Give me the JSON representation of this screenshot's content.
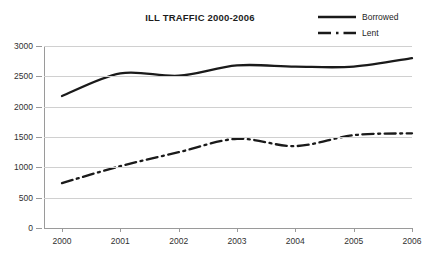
{
  "chart_data": {
    "type": "line",
    "title": "ILL TRAFFIC 2000-2006",
    "xlabel": "",
    "ylabel": "",
    "categories": [
      "2000",
      "2001",
      "2002",
      "2003",
      "2004",
      "2005",
      "2006"
    ],
    "x": [
      2000,
      2001,
      2002,
      2003,
      2004,
      2005,
      2006
    ],
    "series": [
      {
        "name": "Borrowed",
        "style": "solid",
        "color": "#1a1a1a",
        "values": [
          2175,
          2550,
          2510,
          2680,
          2660,
          2660,
          2800
        ]
      },
      {
        "name": "Lent",
        "style": "dash-dot",
        "color": "#1a1a1a",
        "values": [
          740,
          1020,
          1250,
          1470,
          1350,
          1530,
          1560
        ]
      }
    ],
    "ylim": [
      0,
      3000
    ],
    "ytick_values": [
      0,
      500,
      1000,
      1500,
      2000,
      2500,
      3000
    ],
    "ytick_labels": [
      "0",
      "500",
      "1000",
      "1500",
      "2000",
      "2500",
      "3000"
    ],
    "xtick_labels": [
      "2000",
      "2001",
      "2002",
      "2003",
      "2004",
      "2005",
      "2006"
    ],
    "grid": true,
    "grid_axis": "y",
    "legend": [
      "Borrowed",
      "Lent"
    ],
    "legend_position": "top-right"
  }
}
